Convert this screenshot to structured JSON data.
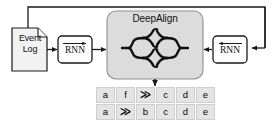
{
  "diagram": {
    "colors": {
      "stroke": "#1a1a1a",
      "doc_fill": "#f2f2f2",
      "deepalign_fill": "#dcdcdc",
      "deepalign_stroke": "#8f8f8f",
      "cell_fill": "#e4e4e4",
      "cell_border": "#cfcfcf",
      "background": "#ffffff"
    }
  },
  "event_log": {
    "line1": "Event",
    "line2": "Log",
    "shape": "document-page-folded-corner"
  },
  "rnn_left": {
    "label": "RNN",
    "direction_icon": "arrow-right-overbar",
    "direction": "forward"
  },
  "rnn_right": {
    "label": "RNN",
    "direction_icon": "arrow-left-overbar",
    "direction": "backward"
  },
  "deepalign": {
    "title": "DeepAlign",
    "network_icon": "encoder-decoder-network-icon"
  },
  "alignment_table": {
    "rows": [
      [
        "a",
        "f",
        "≫",
        "c",
        "d",
        "e"
      ],
      [
        "a",
        "≫",
        "b",
        "c",
        "d",
        "e"
      ]
    ],
    "gap_symbol": "≫"
  },
  "connectors": {
    "log_to_rnn_left": "arrow-right",
    "rnn_left_to_deepalign": "arrow-right",
    "rnn_right_to_deepalign": "arrow-left",
    "deepalign_to_table": "arrow-down",
    "feedback_loop": "top-feedback-loop-right-to-left"
  }
}
